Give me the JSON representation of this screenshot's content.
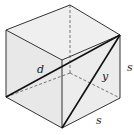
{
  "diagram": {
    "type": "cube-diagonals",
    "labels": {
      "d": "d",
      "y": "y",
      "s_right": "s",
      "s_bottom": "s"
    },
    "colors": {
      "face_fill": "#eeeeee",
      "edge": "#333333",
      "diagonal": "#111111",
      "hidden_edge": "#555555"
    }
  }
}
